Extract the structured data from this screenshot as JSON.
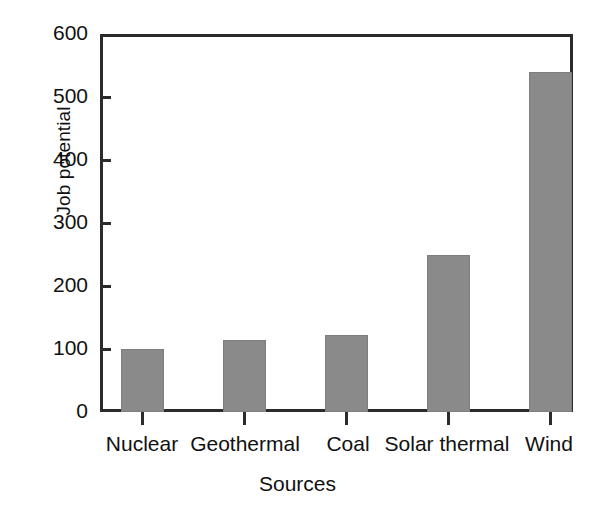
{
  "chart_data": {
    "type": "bar",
    "title": "",
    "xlabel": "Sources",
    "ylabel": "Job potential",
    "categories": [
      "Nuclear",
      "Geothermal",
      "Coal",
      "Solar thermal",
      "Wind"
    ],
    "values": [
      100,
      115,
      122,
      250,
      540
    ],
    "series": [
      {
        "name": "Job potential",
        "values": [
          100,
          115,
          122,
          250,
          540
        ]
      }
    ],
    "ylim": [
      0,
      600
    ],
    "ytick_labels": [
      "0",
      "100",
      "200",
      "300",
      "400",
      "500",
      "600"
    ],
    "ytick_values": [
      0,
      100,
      200,
      300,
      400,
      500,
      600
    ],
    "grid": false,
    "legend": false,
    "legend_position": "none",
    "bar_color": "#8a8a8a",
    "axis_color": "#2b2b2b",
    "background_color": "#ffffff",
    "text_color": "#111111"
  }
}
